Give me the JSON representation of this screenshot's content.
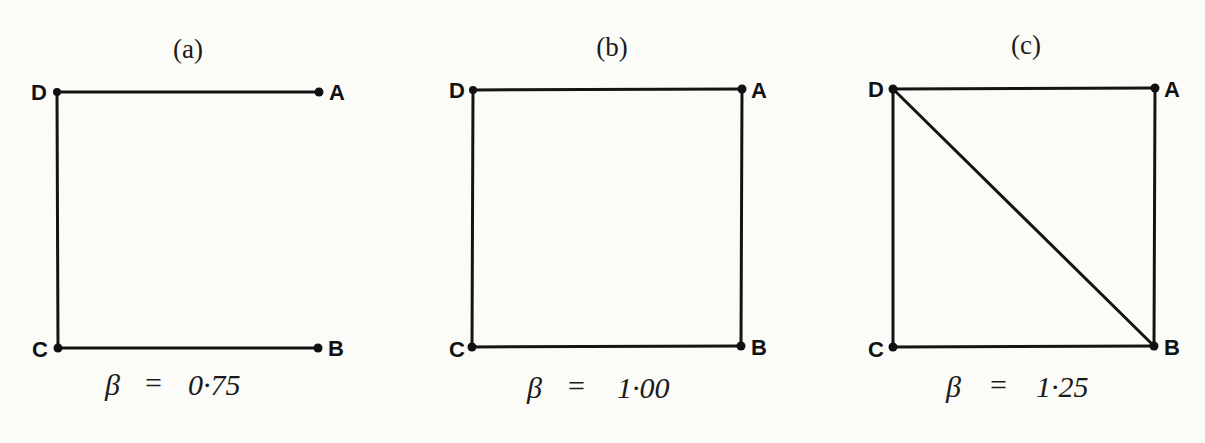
{
  "colors": {
    "background": "#fbfbf8",
    "line": "#141414",
    "node": "#111111",
    "text": "#1a1a1a"
  },
  "panels": [
    {
      "id": "a",
      "caption": "(a)",
      "caption_letter": "a",
      "beta_symbol": "β",
      "equals": "=",
      "beta_value": "0·75",
      "nodes": {
        "D": {
          "label": "D",
          "x": 57,
          "y": 92
        },
        "A": {
          "label": "A",
          "x": 319,
          "y": 92
        },
        "C": {
          "label": "C",
          "x": 58,
          "y": 348
        },
        "B": {
          "label": "B",
          "x": 318,
          "y": 348
        }
      },
      "edges": [
        [
          "D",
          "A"
        ],
        [
          "D",
          "C"
        ],
        [
          "C",
          "B"
        ]
      ]
    },
    {
      "id": "b",
      "caption": "(b)",
      "caption_letter": "b",
      "beta_symbol": "β",
      "equals": "=",
      "beta_value": "1·00",
      "nodes": {
        "D": {
          "label": "D",
          "x": 473,
          "y": 90
        },
        "A": {
          "label": "A",
          "x": 742,
          "y": 89
        },
        "C": {
          "label": "C",
          "x": 472,
          "y": 347
        },
        "B": {
          "label": "B",
          "x": 741,
          "y": 346
        }
      },
      "edges": [
        [
          "D",
          "A"
        ],
        [
          "D",
          "C"
        ],
        [
          "C",
          "B"
        ],
        [
          "A",
          "B"
        ]
      ]
    },
    {
      "id": "c",
      "caption": "(c)",
      "caption_letter": "c",
      "beta_symbol": "β",
      "equals": "=",
      "beta_value": "1·25",
      "nodes": {
        "D": {
          "label": "D",
          "x": 893,
          "y": 89
        },
        "A": {
          "label": "A",
          "x": 1155,
          "y": 88
        },
        "C": {
          "label": "C",
          "x": 893,
          "y": 347
        },
        "B": {
          "label": "B",
          "x": 1154,
          "y": 346
        }
      },
      "edges": [
        [
          "D",
          "A"
        ],
        [
          "D",
          "C"
        ],
        [
          "C",
          "B"
        ],
        [
          "A",
          "B"
        ],
        [
          "D",
          "B"
        ]
      ]
    }
  ]
}
